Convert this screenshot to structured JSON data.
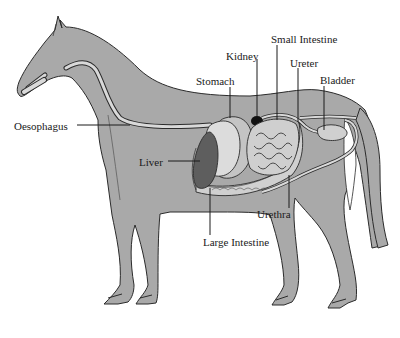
{
  "diagram": {
    "colors": {
      "body": "#a9a9a9",
      "outline": "#2b2b2b",
      "tube": "#d9d9d9",
      "liver": "#5e5e5e",
      "kidney": "#111111",
      "stomach": "#d4d4d4",
      "intestine": "#cfcfcf",
      "label_text": "#1a1a1a",
      "background": "#ffffff"
    },
    "labels": {
      "small_intestine": "Small Intestine",
      "kidney": "Kidney",
      "ureter": "Ureter",
      "stomach": "Stomach",
      "bladder": "Bladder",
      "oesophagus": "Oesophagus",
      "liver": "Liver",
      "urethra": "Urethra",
      "large_intestine": "Large Intestine"
    }
  }
}
